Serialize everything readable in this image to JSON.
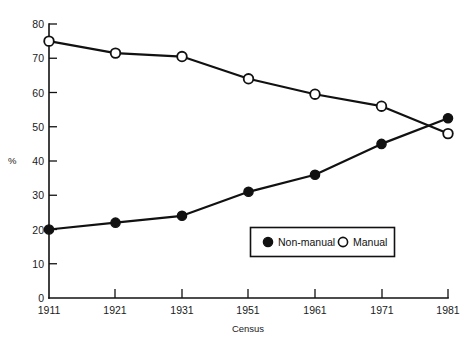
{
  "chart_data": {
    "type": "line",
    "title": "",
    "xlabel": "Census",
    "ylabel": "%",
    "categories": [
      "1911",
      "1921",
      "1931",
      "1951",
      "1961",
      "1971",
      "1981"
    ],
    "series": [
      {
        "name": "Non-manual",
        "marker": "filled-circle",
        "values": [
          20,
          22,
          24,
          31,
          36,
          45,
          52.5
        ]
      },
      {
        "name": "Manual",
        "marker": "open-circle",
        "values": [
          75,
          71.5,
          70.5,
          64,
          59.5,
          56,
          48
        ]
      }
    ],
    "ylim": [
      0,
      80
    ],
    "yticks": [
      "0",
      "10",
      "20",
      "30",
      "40",
      "50",
      "60",
      "70",
      "80"
    ],
    "ytick_values": [
      0,
      10,
      20,
      30,
      40,
      50,
      60,
      70,
      80
    ],
    "grid": false,
    "legend_position": "inside-lower-right",
    "line_color": "#111111",
    "axis_color": "#111111",
    "background_color": "#ffffff"
  },
  "legend": {
    "entries": [
      {
        "label": "Non-manual",
        "marker": "filled-circle"
      },
      {
        "label": "Manual",
        "marker": "open-circle"
      }
    ]
  }
}
